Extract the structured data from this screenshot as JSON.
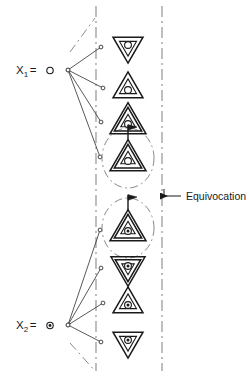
{
  "figure": {
    "annotation": {
      "label": "Equivocation",
      "x": 186,
      "y": 196,
      "arrow_from_x": 181,
      "arrow_to_x": 160,
      "arrow_y": 196,
      "leader_x": 164
    },
    "colors": {
      "ink": "#1a1a1a",
      "line": "#3a3a3a",
      "guide": "#8a8a8a",
      "background": "#ffffff"
    },
    "sources": [
      {
        "name": "source-x1",
        "label_base": "X",
        "label_sub": "1",
        "label_eq": "=",
        "marker": "open-circle",
        "hub_x": 68,
        "hub_y": 70,
        "label_x": 16,
        "label_y": 74
      },
      {
        "name": "source-x2",
        "label_base": "X",
        "label_sub": "2",
        "label_eq": "=",
        "marker": "dotted-circle",
        "hub_x": 68,
        "hub_y": 325,
        "label_x": 16,
        "label_y": 329
      }
    ],
    "guide_lines": [
      {
        "name": "left-channel-boundary",
        "x": 96,
        "y1": 6,
        "y2": 371
      },
      {
        "name": "right-channel-boundary",
        "x": 162,
        "y1": 6,
        "y2": 371
      }
    ],
    "diagonal_guides": [
      {
        "name": "upper-left-diagonal",
        "x1": 70,
        "y1": 52,
        "x2": 95,
        "y2": 18
      },
      {
        "name": "lower-left-diagonal",
        "x1": 70,
        "y1": 343,
        "x2": 95,
        "y2": 371
      }
    ],
    "rays": [
      {
        "name": "ray-x1-1",
        "from": "source-x1",
        "end_x": 101,
        "end_y": 47
      },
      {
        "name": "ray-x1-2",
        "from": "source-x1",
        "end_x": 103,
        "end_y": 88
      },
      {
        "name": "ray-x1-3",
        "from": "source-x1",
        "end_x": 101,
        "end_y": 122
      },
      {
        "name": "ray-x1-4",
        "from": "source-x1",
        "end_x": 100,
        "end_y": 157
      },
      {
        "name": "ray-x2-1",
        "from": "source-x2",
        "end_x": 100,
        "end_y": 230
      },
      {
        "name": "ray-x2-2",
        "from": "source-x2",
        "end_x": 101,
        "end_y": 268
      },
      {
        "name": "ray-x2-3",
        "from": "source-x2",
        "end_x": 103,
        "end_y": 303
      },
      {
        "name": "ray-x2-4",
        "from": "source-x2",
        "end_x": 101,
        "end_y": 342
      }
    ],
    "symbols": [
      {
        "name": "symbol-1",
        "orientation": "down",
        "rings": 1,
        "center_fill": "open",
        "flag": false,
        "cx": 128,
        "cy": 47,
        "size": 30
      },
      {
        "name": "symbol-2",
        "orientation": "up",
        "rings": 1,
        "center_fill": "open",
        "flag": false,
        "cx": 128,
        "cy": 88,
        "size": 30
      },
      {
        "name": "symbol-3",
        "orientation": "up",
        "rings": 2,
        "center_fill": "open",
        "flag": false,
        "cx": 128,
        "cy": 122,
        "size": 36
      },
      {
        "name": "symbol-4",
        "orientation": "up",
        "rings": 2,
        "center_fill": "open",
        "flag": true,
        "cx": 128,
        "cy": 159,
        "size": 36
      },
      {
        "name": "symbol-5",
        "orientation": "up",
        "rings": 2,
        "center_fill": "dotted",
        "flag": true,
        "cx": 128,
        "cy": 229,
        "size": 36
      },
      {
        "name": "symbol-6",
        "orientation": "down",
        "rings": 2,
        "center_fill": "dotted",
        "flag": false,
        "cx": 128,
        "cy": 268,
        "size": 34
      },
      {
        "name": "symbol-7",
        "orientation": "up",
        "rings": 1,
        "center_fill": "dotted",
        "flag": false,
        "cx": 128,
        "cy": 303,
        "size": 30
      },
      {
        "name": "symbol-8",
        "orientation": "down",
        "rings": 1,
        "center_fill": "dotted",
        "flag": false,
        "cx": 128,
        "cy": 342,
        "size": 30
      }
    ],
    "enclosures": [
      {
        "name": "equivocation-enclosure-upper",
        "cx": 128,
        "cy": 158,
        "rx": 26,
        "ry": 30
      },
      {
        "name": "equivocation-enclosure-lower",
        "cx": 128,
        "cy": 228,
        "rx": 26,
        "ry": 30
      }
    ]
  }
}
